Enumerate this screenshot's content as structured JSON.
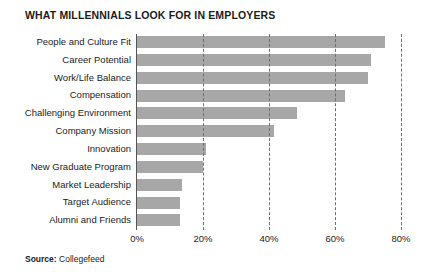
{
  "chart_data": {
    "type": "bar",
    "orientation": "horizontal",
    "title": "WHAT MILLENNIALS LOOK FOR IN EMPLOYERS",
    "xlabel": "",
    "ylabel": "",
    "xlim": [
      0,
      80
    ],
    "xticks": [
      "0%",
      "20%",
      "40%",
      "60%",
      "80%"
    ],
    "xtick_values": [
      0,
      20,
      40,
      60,
      80
    ],
    "grid": "vertical-dashed",
    "legend": "none",
    "bar_color": "#a7a7a7",
    "categories": [
      "People and Culture Fit",
      "Career Potential",
      "Work/Life Balance",
      "Compensation",
      "Challenging Environment",
      "Company Mission",
      "Innovation",
      "New Graduate Program",
      "Market Leadership",
      "Target Audience",
      "Alumni and Friends"
    ],
    "values": [
      75,
      71,
      70,
      63,
      48.5,
      41.5,
      21,
      20,
      13.5,
      13,
      13
    ]
  },
  "footer": {
    "source_label": "Source:",
    "source_value": "Collegefeed"
  }
}
